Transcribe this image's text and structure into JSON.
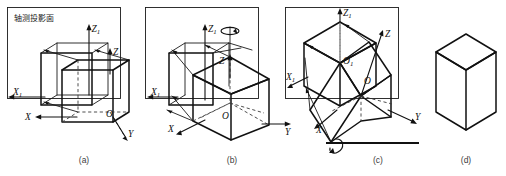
{
  "figure": {
    "title_text": "轴测投影面",
    "background_color": "#ffffff",
    "line_color": "#111111",
    "dash_color": "#3a3a3a",
    "width": 506,
    "height": 176
  },
  "panels": [
    {
      "caption": "(a)",
      "description": "Cube aligned with coordinate axes in front of the axonometric projection plane",
      "plane_label": "轴测投影面",
      "axes": [
        {
          "name": "Z1",
          "letter": "Z",
          "sub": "1"
        },
        {
          "name": "Z",
          "letter": "Z",
          "sub": ""
        },
        {
          "name": "X1",
          "letter": "X",
          "sub": "1"
        },
        {
          "name": "X",
          "letter": "X",
          "sub": ""
        },
        {
          "name": "Y",
          "letter": "Y",
          "sub": ""
        },
        {
          "name": "O",
          "letter": "O",
          "sub": ""
        }
      ],
      "has_projection_plane": true,
      "has_rotation_arrow": false
    },
    {
      "caption": "(b)",
      "description": "Cube rotated about the vertical Z axis",
      "axes": [
        {
          "name": "Z1",
          "letter": "Z",
          "sub": "1"
        },
        {
          "name": "Z",
          "letter": "Z",
          "sub": ""
        },
        {
          "name": "X1",
          "letter": "X",
          "sub": "1"
        },
        {
          "name": "X",
          "letter": "X",
          "sub": ""
        },
        {
          "name": "Y",
          "letter": "Y",
          "sub": ""
        },
        {
          "name": "O",
          "letter": "O",
          "sub": ""
        }
      ],
      "has_projection_plane": true,
      "has_rotation_arrow": true,
      "rotation_axis": "vertical"
    },
    {
      "caption": "(c)",
      "description": "Cube additionally tilted about a horizontal axis",
      "axes": [
        {
          "name": "Z1",
          "letter": "Z",
          "sub": "1"
        },
        {
          "name": "Z",
          "letter": "Z",
          "sub": ""
        },
        {
          "name": "X1",
          "letter": "X",
          "sub": "1"
        },
        {
          "name": "X",
          "letter": "X",
          "sub": ""
        },
        {
          "name": "Y",
          "letter": "Y",
          "sub": ""
        },
        {
          "name": "O1",
          "letter": "O",
          "sub": "1"
        },
        {
          "name": "O",
          "letter": "O",
          "sub": ""
        }
      ],
      "has_projection_plane": true,
      "has_rotation_arrow": true,
      "rotation_axis": "horizontal"
    },
    {
      "caption": "(d)",
      "description": "Resulting isometric view of the cube",
      "axes": [],
      "has_projection_plane": false,
      "has_rotation_arrow": false
    }
  ],
  "labels": {
    "z1": "Z",
    "z1_sub": "1",
    "z": "Z",
    "x1": "X",
    "x1_sub": "1",
    "x": "X",
    "y": "Y",
    "o": "O",
    "o1": "O",
    "o1_sub": "1",
    "cap_a": "(a)",
    "cap_b": "(b)",
    "cap_c": "(c)",
    "cap_d": "(d)"
  }
}
